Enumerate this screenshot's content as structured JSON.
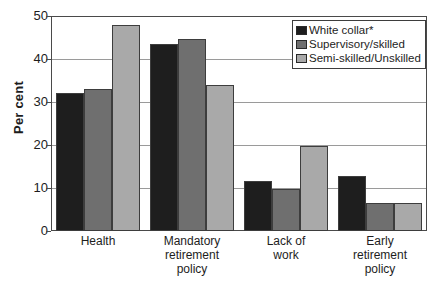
{
  "chart_data": {
    "type": "bar",
    "title": "",
    "subtitle": "",
    "xlabel": "",
    "ylabel": "Per cent",
    "ylim": [
      0,
      50
    ],
    "yticks": [
      0,
      10,
      20,
      30,
      40,
      50
    ],
    "ytick_labels": [
      "0",
      "10",
      "20",
      "30",
      "40",
      "50"
    ],
    "grid": true,
    "legend_position": "top-right",
    "categories": [
      "Health",
      "Mandatory retirement policy",
      "Lack of work",
      "Early retirement policy"
    ],
    "category_lines": [
      [
        "Health"
      ],
      [
        "Mandatory",
        "retirement",
        "policy"
      ],
      [
        "Lack of",
        "work"
      ],
      [
        "Early",
        "retirement",
        "policy"
      ]
    ],
    "series": [
      {
        "name": "White collar*",
        "color": "#1e1e1e",
        "values": [
          32,
          43.5,
          11.7,
          12.8
        ]
      },
      {
        "name": "Supervisory/skilled",
        "color": "#6f6f6f",
        "values": [
          33,
          44.7,
          9.8,
          6.6
        ]
      },
      {
        "name": "Semi-skilled/Unskilled",
        "color": "#a9a9a9",
        "values": [
          48,
          34,
          19.8,
          6.6
        ]
      }
    ]
  }
}
